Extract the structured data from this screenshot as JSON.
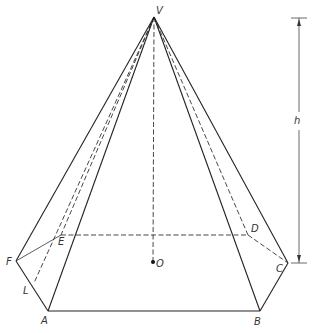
{
  "figure": {
    "labels": {
      "apex": "V",
      "a": "A",
      "b": "B",
      "c": "C",
      "d": "D",
      "e": "E",
      "f": "F",
      "center": "O",
      "slant_foot": "L",
      "height": "h"
    },
    "visible_edges": [
      "VF",
      "VA",
      "VB",
      "VC",
      "FA",
      "AB",
      "BC"
    ],
    "hidden_edges": [
      "VE",
      "VD",
      "VO",
      "VL",
      "FE",
      "ED",
      "DC"
    ]
  }
}
